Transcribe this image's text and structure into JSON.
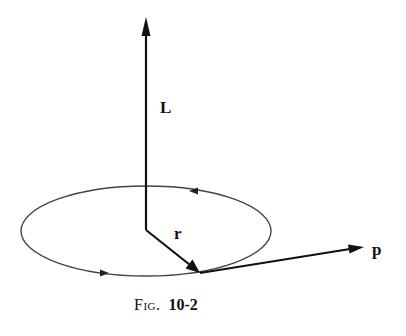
{
  "figure": {
    "labels": {
      "L": "L",
      "r": "r",
      "p": "p"
    },
    "caption": {
      "prefix": "Fig.",
      "number": "10-2"
    },
    "elements": {
      "orbit": "ellipse orbit with counterclockwise direction arrows",
      "L_vector": "angular momentum vector pointing up from orbit center",
      "r_vector": "position vector from center to particle on orbit",
      "p_vector": "momentum vector tangent to orbit"
    },
    "colors": {
      "ink": "#111111",
      "orbit": "#444444",
      "background": "#ffffff"
    }
  }
}
